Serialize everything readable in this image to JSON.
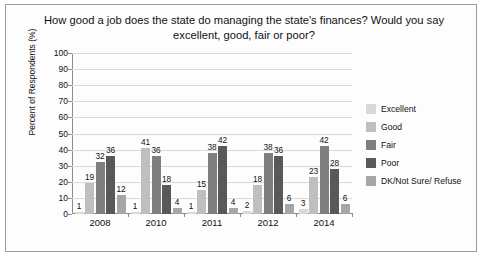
{
  "chart_data": {
    "type": "bar",
    "title": "How good a job does the state do managing the state's finances? Would you say excellent, good, fair or poor?",
    "xlabel": "",
    "ylabel": "Percent of Respondents (%)",
    "categories": [
      "2008",
      "2010",
      "2011",
      "2012",
      "2014"
    ],
    "ylim": [
      0,
      100
    ],
    "yticks": [
      "0",
      "10",
      "20",
      "30",
      "40",
      "50",
      "60",
      "70",
      "80",
      "90",
      "100"
    ],
    "grid": true,
    "legend_position": "right",
    "series": [
      {
        "name": "Excellent",
        "color": "#d9d9d9",
        "values": [
          1,
          1,
          1,
          2,
          3
        ]
      },
      {
        "name": "Good",
        "color": "#bfbfbf",
        "values": [
          19,
          41,
          15,
          18,
          23
        ]
      },
      {
        "name": "Fair",
        "color": "#7f7f7f",
        "values": [
          32,
          36,
          38,
          38,
          42
        ]
      },
      {
        "name": "Poor",
        "color": "#595959",
        "values": [
          36,
          18,
          42,
          36,
          28
        ]
      },
      {
        "name": "DK/Not Sure/ Refuse",
        "color": "#a6a6a6",
        "values": [
          12,
          4,
          4,
          6,
          6
        ]
      }
    ]
  }
}
